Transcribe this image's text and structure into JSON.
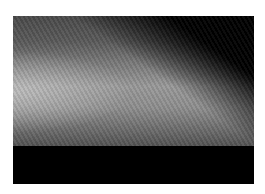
{
  "image": {
    "description": "Grayscale photographic image: a bright diffuse horizontal band across the middle, fading to black at the top-right and bottom",
    "colors": {
      "border": "#ffffff",
      "dark": "#000000",
      "band_bright": "#bdbdbd",
      "band_mid": "#7a7a7a"
    }
  }
}
